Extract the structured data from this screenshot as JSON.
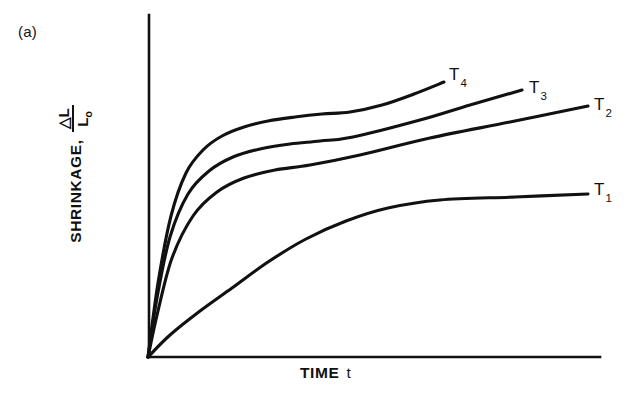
{
  "figure": {
    "panel_label": "(a)",
    "background_color": "#ffffff",
    "ink_color": "#111111"
  },
  "axes": {
    "y_label_text": "SHRINKAGE,",
    "y_label_numerator": "△L",
    "y_label_denominator": "L",
    "y_label_denominator_sub": "o",
    "x_label_text": "TIME",
    "x_label_variable": "t"
  },
  "series_labels": [
    {
      "id": "T4",
      "base": "T",
      "sub": "4"
    },
    {
      "id": "T3",
      "base": "T",
      "sub": "3"
    },
    {
      "id": "T2",
      "base": "T",
      "sub": "2"
    },
    {
      "id": "T1",
      "base": "T",
      "sub": "1"
    }
  ],
  "chart_data": {
    "type": "line",
    "title": "",
    "subtitle": "",
    "xlabel": "TIME  t",
    "ylabel": "SHRINKAGE, ΔL/L₀",
    "xlim": [
      0,
      100
    ],
    "ylim": [
      0,
      100
    ],
    "grid": false,
    "axis_ticks": false,
    "tick_labels": {
      "x": [],
      "y": []
    },
    "legend": "inline-end-of-curve",
    "legend_position": "right",
    "annotations": [
      {
        "text": "(a)",
        "x_px": 18,
        "y_px": 23,
        "role": "panel-label"
      }
    ],
    "axis_geometry_px": {
      "origin": [
        148,
        357
      ],
      "y_axis_top": [
        148,
        15
      ],
      "x_axis_right": [
        600,
        357
      ]
    },
    "series": [
      {
        "name": "T4",
        "label": "T₄",
        "color": "#111111",
        "rank": 4,
        "initial_slope": "steepest",
        "plateau_level": 88,
        "x": [
          0,
          3,
          7,
          12,
          18,
          25,
          33,
          42,
          52,
          62,
          72,
          82,
          92,
          100
        ],
        "y": [
          0,
          30,
          52,
          66,
          74,
          79,
          82,
          84,
          85.5,
          86.5,
          87.3,
          88,
          88.6,
          89
        ],
        "points_px": [
          [
            148,
            357
          ],
          [
            158,
            283
          ],
          [
            171,
            216
          ],
          [
            186,
            173
          ],
          [
            203,
            150
          ],
          [
            222,
            136
          ],
          [
            244,
            127
          ],
          [
            268,
            121
          ],
          [
            295,
            117
          ],
          [
            322,
            114
          ],
          [
            350,
            112
          ],
          [
            382,
            105
          ],
          [
            414,
            94
          ],
          [
            444,
            82
          ]
        ]
      },
      {
        "name": "T3",
        "label": "T₃",
        "color": "#111111",
        "rank": 3,
        "initial_slope": "steep",
        "plateau_level": 80,
        "x": [
          0,
          3,
          8,
          14,
          21,
          29,
          38,
          48,
          58,
          69,
          80,
          90,
          100
        ],
        "y": [
          0,
          24,
          44,
          58,
          66,
          71,
          74,
          76,
          77.5,
          79,
          80.5,
          82,
          83.5
        ],
        "points_px": [
          [
            148,
            357
          ],
          [
            157,
            298
          ],
          [
            170,
            237
          ],
          [
            188,
            194
          ],
          [
            209,
            171
          ],
          [
            233,
            157
          ],
          [
            260,
            149
          ],
          [
            290,
            144
          ],
          [
            320,
            141
          ],
          [
            353,
            137
          ],
          [
            420,
            120
          ],
          [
            470,
            105
          ],
          [
            522,
            90
          ]
        ]
      },
      {
        "name": "T2",
        "label": "T₂",
        "color": "#111111",
        "rank": 2,
        "initial_slope": "moderate",
        "plateau_level": 70,
        "x": [
          0,
          4,
          9,
          16,
          24,
          33,
          43,
          54,
          65,
          76,
          88,
          100
        ],
        "y": [
          0,
          19,
          35,
          48,
          57,
          62,
          65,
          67,
          68.5,
          70,
          72,
          74
        ],
        "points_px": [
          [
            148,
            357
          ],
          [
            158,
            311
          ],
          [
            172,
            258
          ],
          [
            193,
            216
          ],
          [
            217,
            192
          ],
          [
            244,
            178
          ],
          [
            275,
            170
          ],
          [
            310,
            165
          ],
          [
            360,
            155
          ],
          [
            430,
            138
          ],
          [
            510,
            122
          ],
          [
            588,
            106
          ]
        ]
      },
      {
        "name": "T1",
        "label": "T₁",
        "color": "#111111",
        "rank": 1,
        "initial_slope": "shallowest",
        "plateau_level": 46,
        "x": [
          0,
          5,
          12,
          20,
          30,
          41,
          53,
          65,
          77,
          89,
          100
        ],
        "y": [
          0,
          11,
          22,
          31,
          38,
          42,
          44,
          45,
          45.5,
          46,
          46.2
        ],
        "points_px": [
          [
            148,
            357
          ],
          [
            170,
            335
          ],
          [
            200,
            311
          ],
          [
            232,
            288
          ],
          [
            268,
            262
          ],
          [
            306,
            239
          ],
          [
            346,
            221
          ],
          [
            388,
            208
          ],
          [
            440,
            200
          ],
          [
            515,
            197
          ],
          [
            588,
            194
          ]
        ]
      }
    ]
  }
}
